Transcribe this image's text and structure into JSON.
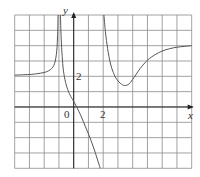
{
  "chart_data": {
    "type": "line",
    "title": "",
    "xlabel": "x",
    "ylabel": "y",
    "xlim": [
      -4,
      8
    ],
    "ylim": [
      -4,
      6
    ],
    "grid": true,
    "grid_step": 1,
    "tick_labels": {
      "origin": "0",
      "x": [
        {
          "value": 2,
          "label": "2"
        }
      ],
      "y": [
        {
          "value": 2,
          "label": "2"
        }
      ]
    },
    "asymptotes": {
      "vertical": [
        -1,
        2
      ],
      "horizontal_left": 2,
      "horizontal_right": 4
    },
    "series": [
      {
        "name": "left-branch",
        "points": [
          [
            -4,
            2.08
          ],
          [
            -3,
            2.12
          ],
          [
            -2.5,
            2.17
          ],
          [
            -2,
            2.25
          ],
          [
            -1.7,
            2.36
          ],
          [
            -1.5,
            2.5
          ],
          [
            -1.35,
            2.71
          ],
          [
            -1.25,
            3.0
          ],
          [
            -1.18,
            3.4
          ],
          [
            -1.13,
            3.9
          ],
          [
            -1.1,
            4.5
          ],
          [
            -1.08,
            5.1
          ],
          [
            -1.06,
            6.0
          ]
        ]
      },
      {
        "name": "middle-branch",
        "points": [
          [
            -0.9,
            6.0
          ],
          [
            -0.85,
            4.5
          ],
          [
            -0.78,
            3.3
          ],
          [
            -0.7,
            2.4
          ],
          [
            -0.55,
            1.6
          ],
          [
            -0.35,
            1.0
          ],
          [
            -0.15,
            0.6
          ],
          [
            0,
            0.37
          ],
          [
            0.2,
            0.0
          ],
          [
            0.5,
            -0.6
          ],
          [
            0.8,
            -1.3
          ],
          [
            1.1,
            -2.0
          ],
          [
            1.4,
            -2.8
          ],
          [
            1.6,
            -3.4
          ],
          [
            1.8,
            -4.0
          ]
        ]
      },
      {
        "name": "right-branch",
        "points": [
          [
            2.05,
            6.0
          ],
          [
            2.15,
            4.9
          ],
          [
            2.3,
            3.8
          ],
          [
            2.5,
            2.8
          ],
          [
            2.75,
            2.1
          ],
          [
            3.0,
            1.7
          ],
          [
            3.3,
            1.45
          ],
          [
            3.5,
            1.4
          ],
          [
            3.75,
            1.5
          ],
          [
            4.0,
            1.8
          ],
          [
            4.5,
            2.5
          ],
          [
            5.0,
            3.05
          ],
          [
            5.5,
            3.4
          ],
          [
            6.0,
            3.65
          ],
          [
            6.5,
            3.8
          ],
          [
            7.0,
            3.9
          ],
          [
            7.5,
            3.95
          ],
          [
            8.0,
            4.0
          ]
        ]
      }
    ]
  },
  "labels": {
    "x_axis": "x",
    "y_axis": "y",
    "origin": "0",
    "x_tick_2": "2",
    "y_tick_2": "2"
  },
  "colors": {
    "grid": "#8a8a8a",
    "axis": "#222222",
    "curve": "#555555"
  }
}
